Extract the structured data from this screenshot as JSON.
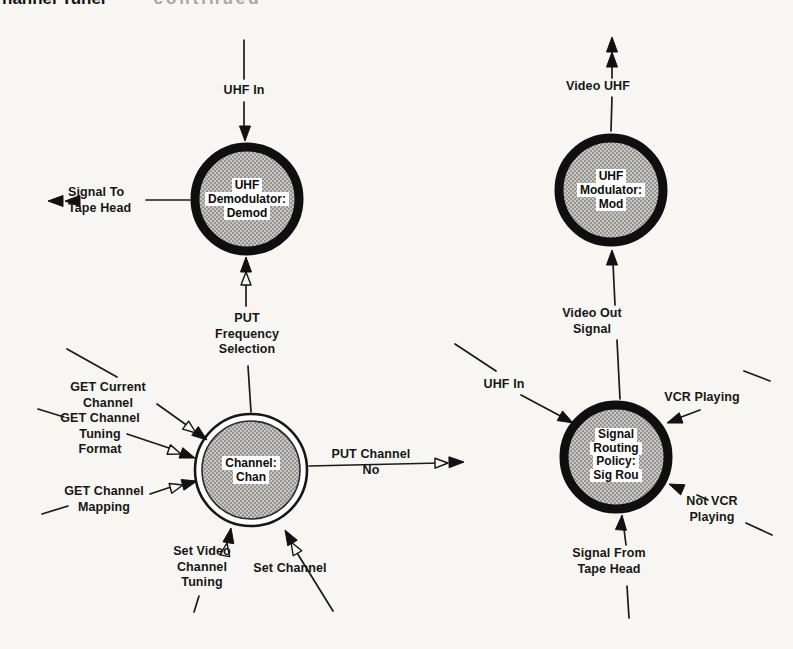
{
  "heading": {
    "bold": "hannel Tuner",
    "light": "continued"
  },
  "nodes": {
    "demodulator": {
      "lines": [
        "UHF",
        "Demodulator:",
        "Demod"
      ]
    },
    "channel": {
      "lines": [
        "Channel:",
        "Chan"
      ]
    },
    "modulator": {
      "lines": [
        "UHF",
        "Modulator:",
        "Mod"
      ]
    },
    "signal_routing": {
      "lines": [
        "Signal",
        "Routing",
        "Policy:",
        "Sig Rou"
      ]
    }
  },
  "flows": {
    "uhf_in_left": "UHF In",
    "signal_to_tape_head": "Signal To\nTape Head",
    "put_frequency_selection": "PUT\nFrequency\nSelection",
    "get_current_channel": "GET Current\nChannel",
    "get_channel_tuning_format": "GET Channel\nTuning\nFormat",
    "get_channel_mapping": "GET Channel\nMapping",
    "put_channel_no": "PUT Channel\nNo",
    "set_video_channel_tuning": "Set Video\nChannel\nTuning",
    "set_channel": "Set Channel",
    "video_uhf": "Video UHF",
    "video_out_signal": "Video Out\nSignal",
    "uhf_in_right": "UHF In",
    "vcr_playing": "VCR Playing",
    "not_vcr_playing": "Not VCR\nPlaying",
    "signal_from_tape_head": "Signal From\nTape Head"
  },
  "colors": {
    "ink": "#1a1a1a",
    "node_ring": "#0f0f0f",
    "node_fill_base": "#c7c6c3",
    "node_fill_dot": "#8f8e8b",
    "paper": "#f7f6f3"
  }
}
